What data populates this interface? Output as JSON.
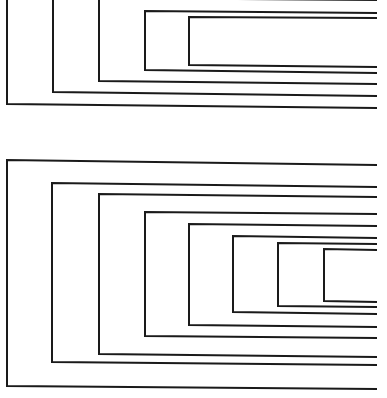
{
  "figure": {
    "width": 387,
    "height": 398,
    "stroke_color": "#1a1a1a",
    "background": "#ffffff",
    "right_edge_x": 377
  },
  "groups": [
    {
      "name": "top-nested-brackets",
      "brackets": [
        {
          "left_x": 7,
          "top_y": -2,
          "bottom_y": 104,
          "top_right_y": -2,
          "bottom_right_y": 108
        },
        {
          "left_x": 53,
          "top_y": -2,
          "bottom_y": 92,
          "top_right_y": -2,
          "bottom_right_y": 96
        },
        {
          "left_x": 99,
          "top_y": -2,
          "bottom_y": 81,
          "top_right_y": 0,
          "bottom_right_y": 84
        },
        {
          "left_x": 145,
          "top_y": 11,
          "bottom_y": 70,
          "top_right_y": 13,
          "bottom_right_y": 73
        },
        {
          "left_x": 189,
          "top_y": 17,
          "bottom_y": 65,
          "top_right_y": 18,
          "bottom_right_y": 67
        }
      ]
    },
    {
      "name": "bottom-nested-brackets",
      "brackets": [
        {
          "left_x": 7,
          "top_y": 160,
          "bottom_y": 386,
          "top_right_y": 165,
          "bottom_right_y": 389
        },
        {
          "left_x": 52,
          "top_y": 183,
          "bottom_y": 362,
          "top_right_y": 187,
          "bottom_right_y": 365
        },
        {
          "left_x": 99,
          "top_y": 194,
          "bottom_y": 354,
          "top_right_y": 197,
          "bottom_right_y": 357
        },
        {
          "left_x": 145,
          "top_y": 212,
          "bottom_y": 336,
          "top_right_y": 214,
          "bottom_right_y": 338
        },
        {
          "left_x": 189,
          "top_y": 224,
          "bottom_y": 325,
          "top_right_y": 226,
          "bottom_right_y": 327
        },
        {
          "left_x": 233,
          "top_y": 236,
          "bottom_y": 312,
          "top_right_y": 238,
          "bottom_right_y": 314
        },
        {
          "left_x": 278,
          "top_y": 243,
          "bottom_y": 306,
          "top_right_y": 244,
          "bottom_right_y": 307
        },
        {
          "left_x": 324,
          "top_y": 249,
          "bottom_y": 301,
          "top_right_y": 250,
          "bottom_right_y": 302
        }
      ]
    }
  ]
}
